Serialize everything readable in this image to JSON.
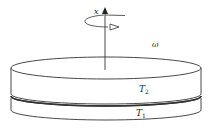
{
  "diagram": {
    "axis_label": "x",
    "angular_velocity_label": "ω",
    "layers": [
      {
        "name": "upper",
        "label_main": "T",
        "label_sub": "2"
      },
      {
        "name": "lower",
        "label_main": "T",
        "label_sub": "1"
      }
    ],
    "colors": {
      "stroke": "#333333",
      "background": "#ffffff"
    }
  }
}
